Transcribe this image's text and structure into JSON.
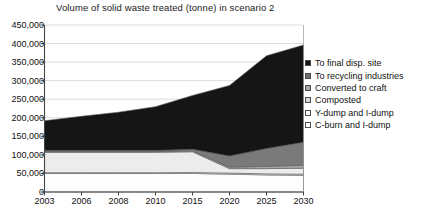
{
  "chart_data": {
    "type": "area",
    "stacked": true,
    "title": "Volume of solid waste treated (tonne) in scenario 2",
    "xlabel": "",
    "ylabel": "",
    "categories": [
      "2003",
      "2006",
      "2008",
      "2010",
      "2015",
      "2020",
      "2025",
      "2030"
    ],
    "x_tick_labels": [
      "2003",
      "2006",
      "2008",
      "2010",
      "2015",
      "2020",
      "2025",
      "2030"
    ],
    "y_tick_labels": [
      "0",
      "50,000",
      "100,000",
      "150,000",
      "200,000",
      "250,000",
      "300,000",
      "350,000",
      "400,000",
      "450,000"
    ],
    "y_tick_values": [
      0,
      50000,
      100000,
      150000,
      200000,
      250000,
      300000,
      350000,
      400000,
      450000
    ],
    "ylim": [
      0,
      450000
    ],
    "grid": true,
    "grid_axis": "y",
    "legend_position": "right",
    "series": [
      {
        "name": "To final disp. site",
        "color": "#151515",
        "values": [
          80000,
          92000,
          103000,
          118000,
          145000,
          190000,
          250000,
          262000
        ]
      },
      {
        "name": "To recycling industries",
        "color": "#7a7a7a",
        "values": [
          3000,
          3000,
          3000,
          3000,
          4000,
          30000,
          48000,
          62000
        ]
      },
      {
        "name": "Converted to craft",
        "color": "#a8a8a8",
        "values": [
          2000,
          2000,
          2000,
          2000,
          2500,
          4000,
          6000,
          8000
        ]
      },
      {
        "name": "Composted",
        "color": "#ececec",
        "values": [
          55000,
          55000,
          55000,
          55000,
          56000,
          12000,
          14000,
          16000
        ]
      },
      {
        "name": "Y-dump and I-dump",
        "color": "#ffffff",
        "values": [
          2000,
          2000,
          2000,
          2000,
          2500,
          3000,
          3000,
          3000
        ]
      },
      {
        "name": "C-burn and I-dump",
        "color": "#fdfdfd",
        "values": [
          50000,
          50000,
          50000,
          50000,
          50000,
          48000,
          46000,
          45000
        ]
      }
    ],
    "totals": [
      192000,
      204000,
      215000,
      230000,
      260000,
      287000,
      367000,
      396000
    ]
  },
  "legend": {
    "items": [
      {
        "label": "To final disp. site",
        "swatch": "#151515"
      },
      {
        "label": "To recycling industries",
        "swatch": "#6f6f6f"
      },
      {
        "label": "Converted to craft",
        "swatch": "#a8a8a8"
      },
      {
        "label": "Composted",
        "swatch": "#d8d8d8"
      },
      {
        "label": "Y-dump and I-dump",
        "swatch": "#ffffff"
      },
      {
        "label": "C-burn and I-dump",
        "swatch": "#ffffff"
      }
    ]
  },
  "axes": {
    "axis_color": "#444444",
    "grid_color": "#cfcfcf"
  }
}
